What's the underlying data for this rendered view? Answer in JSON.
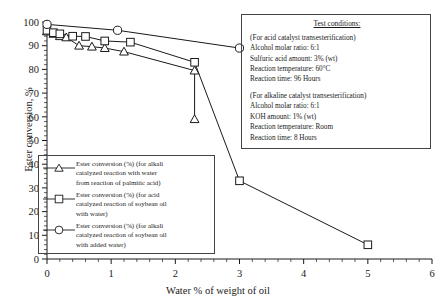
{
  "chart_data": {
    "type": "line",
    "title": "",
    "xlabel": "Water % of weight of oil",
    "ylabel": "Ester conversion, %",
    "xlim": [
      0,
      6
    ],
    "ylim": [
      0,
      100
    ],
    "xticks": [
      0,
      1,
      2,
      3,
      4,
      5,
      6
    ],
    "yticks": [
      0,
      10,
      20,
      30,
      40,
      50,
      60,
      70,
      80,
      90,
      100
    ],
    "xminor_step": 0.2,
    "yminor_step": 2,
    "grid": false,
    "legend_position": "inside-lower-left",
    "series": [
      {
        "name": "Ester conversion (%) (for alkali catalyzed reaction with water from reaction of palmitic acid)",
        "marker": "triangle",
        "x": [
          0.0,
          0.1,
          0.2,
          0.3,
          0.5,
          0.7,
          0.9,
          1.2,
          2.3
        ],
        "y": [
          96.0,
          95.0,
          94.0,
          93.5,
          90.0,
          89.6,
          89.0,
          87.5,
          79.5
        ]
      },
      {
        "name": "Ester conversion (%) (for acid catalyzed reaction of soybean oil with water)",
        "marker": "square",
        "x": [
          0.0,
          0.1,
          0.2,
          0.4,
          0.6,
          0.9,
          1.3,
          2.3,
          3.0,
          5.0
        ],
        "y": [
          96.5,
          95.5,
          95.0,
          94.0,
          93.9,
          92.0,
          91.5,
          83.0,
          33.0,
          6.0
        ]
      },
      {
        "name": "Ester conversion (%) (for alkali catalyzed reaction of soybean oil with added water)",
        "marker": "circle",
        "x": [
          0.0,
          1.1,
          3.0
        ],
        "y": [
          99.0,
          96.5,
          89.0
        ]
      }
    ],
    "triangle_tail": {
      "x": [
        2.3
      ],
      "y": [
        59.0
      ]
    }
  },
  "test_conditions": {
    "title": "Test conditions:",
    "acid_section": [
      "(For acid catalyst transesterification)",
      "Alcohol molar ratio: 6:1",
      "Sulfuric acid amount: 3% (wt)",
      "Reaction temperature: 60°C",
      "Reaction time: 96 Hours"
    ],
    "alkaline_section": [
      "(For alkaline catalyst transesterification)",
      "Alcohol molar ratio: 6:1",
      "KOH amount: 1% (wt)",
      "Reaction temperature: Room",
      "Reaction time: 8 Hours"
    ]
  },
  "legend": {
    "items": [
      {
        "marker": "triangle",
        "lines": [
          "Ester conversion (%) (for alkali",
          "catalyzed reaction with water",
          "from reaction of palmitic acid)"
        ]
      },
      {
        "marker": "square",
        "lines": [
          "Ester conversion (%) (for acid",
          "catalyzed reaction of soybean oil",
          "with water)"
        ]
      },
      {
        "marker": "circle",
        "lines": [
          "Ester conversion (%) (for alkali",
          "catalyzed reaction of soybean oil",
          "with added water)"
        ]
      }
    ]
  },
  "colors": {
    "line": "#1a1a1a",
    "axis": "#1a1a1a",
    "background": "#ffffff"
  }
}
